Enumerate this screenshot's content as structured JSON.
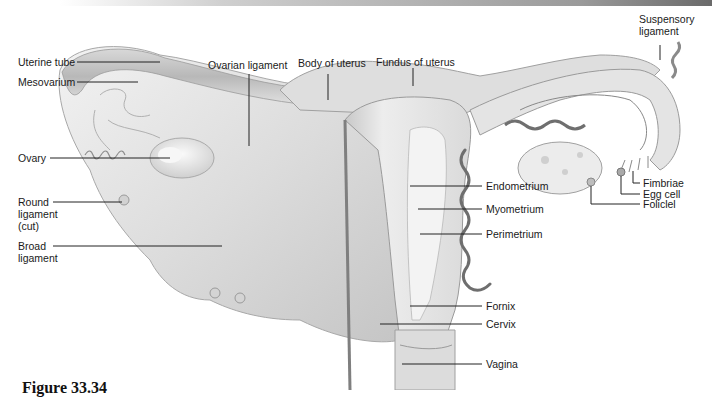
{
  "figure": {
    "caption": "Figure 33.34"
  },
  "labels": {
    "uterine_tube": "Uterine tube",
    "mesovarium": "Mesovarium",
    "ovarian_ligament": "Ovarian ligament",
    "body_of_uterus": "Body of uterus",
    "fundus_of_uterus": "Fundus of uterus",
    "suspensory_ligament_1": "Suspensory",
    "suspensory_ligament_2": "ligament",
    "ovary": "Ovary",
    "round_ligament_1": "Round",
    "round_ligament_2": "ligament",
    "round_ligament_3": "(cut)",
    "broad_ligament_1": "Broad",
    "broad_ligament_2": "ligament",
    "fimbriae": "Fimbriae",
    "egg_cell": "Egg cell",
    "follicle": "Foliclel",
    "endometrium": "Endometrium",
    "myometrium": "Myometrium",
    "perimetrium": "Perimetrium",
    "fornix": "Fornix",
    "cervix": "Cervix",
    "vagina": "Vagina"
  },
  "colors": {
    "tissue_light": "#e9e9e9",
    "tissue_mid": "#cfcfcf",
    "tissue_dark": "#9c9c9c",
    "vessel": "#6e6e6e",
    "leader_line": "#222222"
  }
}
